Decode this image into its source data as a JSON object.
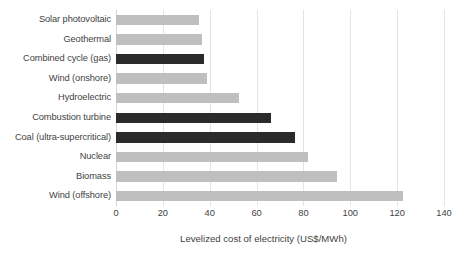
{
  "chart_data": {
    "type": "bar",
    "orientation": "horizontal",
    "title": "",
    "xlabel": "Levelized cost of electricity (US$/MWh)",
    "ylabel": "",
    "xlim": [
      0,
      140
    ],
    "xticks": [
      0,
      20,
      40,
      60,
      80,
      100,
      120,
      140
    ],
    "xtick_labels": [
      "0",
      "20",
      "40",
      "60",
      "80",
      "100",
      "120",
      "140"
    ],
    "grid": true,
    "grid_axis": "x",
    "legend": "none",
    "categories": [
      "Solar photovoltaic",
      "Geothermal",
      "Combined cycle (gas)",
      "Wind (onshore)",
      "Hydroelectric",
      "Combustion turbine",
      "Coal (ultra-supercritical)",
      "Nuclear",
      "Biomass",
      "Wind (offshore)"
    ],
    "values": [
      35.5,
      36.5,
      37.5,
      39,
      52.5,
      66,
      76.5,
      82,
      94.5,
      122.5
    ],
    "bar_colors": [
      "#bfbfbf",
      "#bfbfbf",
      "#2b2b2b",
      "#bfbfbf",
      "#bfbfbf",
      "#2b2b2b",
      "#2b2b2b",
      "#bfbfbf",
      "#bfbfbf",
      "#bfbfbf"
    ],
    "color_groups": {
      "light_gray": "#bfbfbf",
      "dark": "#2b2b2b"
    },
    "background": "#ffffff",
    "gridline_color": "#e4e4e4"
  }
}
